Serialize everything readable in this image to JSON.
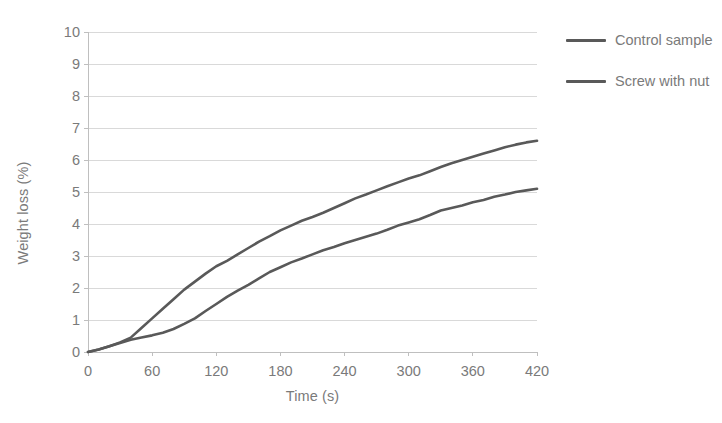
{
  "chart_data": {
    "type": "line",
    "title": "",
    "xlabel": "Time (s)",
    "ylabel": "Weight loss (%)",
    "xlim": [
      0,
      420
    ],
    "ylim": [
      0,
      10
    ],
    "xticks": [
      0,
      60,
      120,
      180,
      240,
      300,
      360,
      420
    ],
    "yticks": [
      0,
      1,
      2,
      3,
      4,
      5,
      6,
      7,
      8,
      9,
      10
    ],
    "grid": "horizontal",
    "legend_position": "right",
    "x": [
      0,
      10,
      20,
      30,
      40,
      50,
      60,
      70,
      80,
      90,
      100,
      110,
      120,
      130,
      140,
      150,
      160,
      170,
      180,
      190,
      200,
      210,
      220,
      230,
      240,
      250,
      260,
      270,
      280,
      290,
      300,
      310,
      320,
      330,
      340,
      350,
      360,
      370,
      380,
      390,
      400,
      410,
      420
    ],
    "series": [
      {
        "name": "Screw with nut",
        "color": "#595959",
        "values": [
          0.0,
          0.08,
          0.18,
          0.3,
          0.45,
          0.75,
          1.05,
          1.35,
          1.65,
          1.95,
          2.2,
          2.45,
          2.68,
          2.85,
          3.05,
          3.25,
          3.45,
          3.62,
          3.8,
          3.95,
          4.1,
          4.22,
          4.35,
          4.5,
          4.65,
          4.8,
          4.92,
          5.05,
          5.18,
          5.3,
          5.42,
          5.52,
          5.65,
          5.78,
          5.9,
          6.0,
          6.1,
          6.2,
          6.3,
          6.4,
          6.48,
          6.55,
          6.6
        ]
      },
      {
        "name": "Control sample",
        "color": "#595959",
        "values": [
          0.0,
          0.08,
          0.18,
          0.28,
          0.38,
          0.45,
          0.52,
          0.6,
          0.72,
          0.88,
          1.05,
          1.28,
          1.5,
          1.72,
          1.92,
          2.1,
          2.3,
          2.5,
          2.65,
          2.8,
          2.92,
          3.05,
          3.18,
          3.28,
          3.4,
          3.5,
          3.6,
          3.7,
          3.82,
          3.95,
          4.05,
          4.15,
          4.28,
          4.42,
          4.5,
          4.58,
          4.68,
          4.75,
          4.85,
          4.92,
          5.0,
          5.05,
          5.1
        ]
      }
    ]
  },
  "axes": {
    "y_title": "Weight loss (%)",
    "x_title": "Time (s)",
    "y_tick_labels": [
      "10",
      "9",
      "8",
      "7",
      "6",
      "5",
      "4",
      "3",
      "2",
      "1",
      "0"
    ],
    "x_tick_labels": [
      "0",
      "60",
      "120",
      "180",
      "240",
      "300",
      "360",
      "420"
    ]
  },
  "legend": {
    "items": [
      {
        "label": "Control sample",
        "color": "#595959"
      },
      {
        "label": "Screw with nut",
        "color": "#595959"
      }
    ]
  },
  "style": {
    "background": "#ffffff",
    "grid_color": "#d9d9d9",
    "axis_color": "#bfbfbf",
    "text_color": "#7a7a7a",
    "line_color": "#595959"
  }
}
